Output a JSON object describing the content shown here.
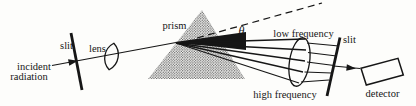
{
  "figure": {
    "colors": {
      "background": "#fdfdfb",
      "ink": "#161616"
    },
    "labels": {
      "incident_line1": "incident",
      "incident_line2": "radiation",
      "slit_left": "slit",
      "lens": "lens",
      "prism": "prism",
      "theta": "θ",
      "low_frequency": "low frequency",
      "high_frequency": "high frequency",
      "slit_right": "slit",
      "detector": "detector"
    }
  }
}
